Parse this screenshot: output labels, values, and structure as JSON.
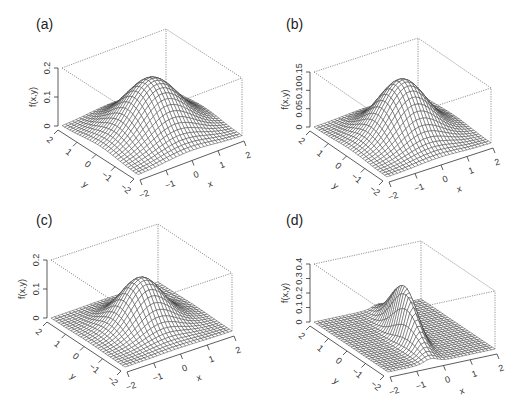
{
  "figure": {
    "panels": [
      {
        "label": "(a)",
        "zlabel": "f(x,y)",
        "xlabel": "x",
        "ylabel": "y",
        "zticks": [
          "0",
          "0.1",
          "0.2"
        ],
        "zmax": 0.2
      },
      {
        "label": "(b)",
        "zlabel": "f(x,y)",
        "xlabel": "x",
        "ylabel": "y",
        "zticks": [
          "0",
          "0.05",
          "0.10",
          "0.15"
        ],
        "zmax": 0.15
      },
      {
        "label": "(c)",
        "zlabel": "f(x,y)",
        "xlabel": "x",
        "ylabel": "y",
        "zticks": [
          "0",
          "0.1",
          "0.2"
        ],
        "zmax": 0.2
      },
      {
        "label": "(d)",
        "zlabel": "f(x,y)",
        "xlabel": "x",
        "ylabel": "y",
        "zticks": [
          "0",
          "0.1",
          "0.2",
          "0.3",
          "0.4"
        ],
        "zmax": 0.4
      }
    ]
  },
  "chart_data": [
    {
      "type": "surface",
      "title": "(a)",
      "xlabel": "x",
      "ylabel": "y",
      "zlabel": "f(x,y)",
      "x_ticks": [
        -2,
        -1,
        0,
        1,
        2
      ],
      "y_ticks": [
        -2,
        -1,
        0,
        1,
        2
      ],
      "z_ticks": [
        0,
        0.1,
        0.2
      ],
      "xlim": [
        -2,
        2
      ],
      "ylim": [
        -2,
        2
      ],
      "zlim": [
        0,
        0.2
      ],
      "surface": {
        "kind": "bivariate_gaussian_like",
        "peak": 0.18,
        "sigma_x": 0.9,
        "sigma_y": 0.9,
        "rho": 0,
        "center": [
          0,
          0
        ]
      },
      "grid": "wireframe 30x30"
    },
    {
      "type": "surface",
      "title": "(b)",
      "xlabel": "x",
      "ylabel": "y",
      "zlabel": "f(x,y)",
      "x_ticks": [
        -2,
        -1,
        0,
        1,
        2
      ],
      "y_ticks": [
        -2,
        -1,
        0,
        1,
        2
      ],
      "z_ticks": [
        0,
        0.05,
        0.1,
        0.15
      ],
      "xlim": [
        -2,
        2
      ],
      "ylim": [
        -2,
        2
      ],
      "zlim": [
        0,
        0.15
      ],
      "surface": {
        "kind": "bivariate_gaussian_like",
        "peak": 0.15,
        "sigma_x": 0.8,
        "sigma_y": 0.8,
        "rho": 0,
        "center": [
          0,
          0
        ]
      },
      "grid": "wireframe 30x30"
    },
    {
      "type": "surface",
      "title": "(c)",
      "xlabel": "x",
      "ylabel": "y",
      "zlabel": "f(x,y)",
      "x_ticks": [
        -2,
        -1,
        0,
        1,
        2
      ],
      "y_ticks": [
        -2,
        -1,
        0,
        1,
        2
      ],
      "z_ticks": [
        0,
        0.1,
        0.2
      ],
      "xlim": [
        -2,
        2
      ],
      "ylim": [
        -2,
        2
      ],
      "zlim": [
        0,
        0.2
      ],
      "surface": {
        "kind": "bivariate_gaussian_like",
        "peak": 0.16,
        "sigma_x": 0.7,
        "sigma_y": 0.7,
        "rho": 0,
        "center": [
          0,
          0
        ]
      },
      "grid": "wireframe 30x30"
    },
    {
      "type": "surface",
      "title": "(d)",
      "xlabel": "x",
      "ylabel": "y",
      "zlabel": "f(x,y)",
      "x_ticks": [
        -2,
        -1,
        0,
        1,
        2
      ],
      "y_ticks": [
        -2,
        -1,
        0,
        1,
        2
      ],
      "z_ticks": [
        0,
        0.1,
        0.2,
        0.3,
        0.4
      ],
      "xlim": [
        -2,
        2
      ],
      "ylim": [
        -2,
        2
      ],
      "zlim": [
        0,
        0.4
      ],
      "surface": {
        "kind": "bivariate_gaussian_like",
        "peak": 0.34,
        "sigma_x": 0.3,
        "sigma_y": 0.9,
        "rho": 0.6,
        "center": [
          0,
          0
        ]
      },
      "grid": "wireframe 30x30"
    }
  ]
}
